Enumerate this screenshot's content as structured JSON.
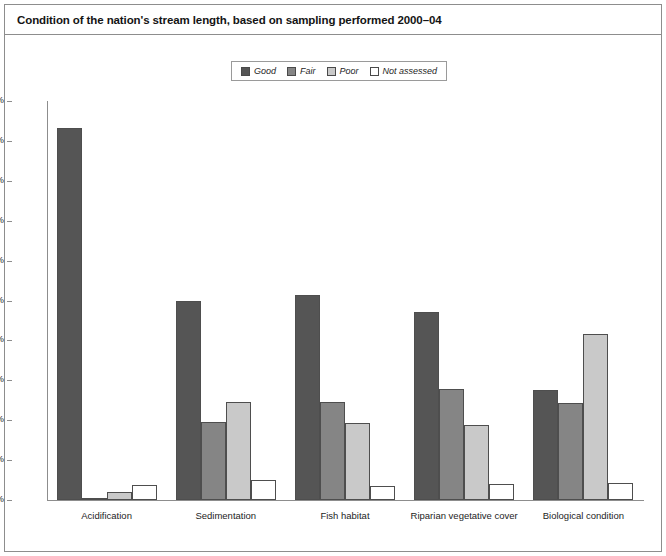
{
  "chart_data": {
    "type": "bar",
    "title": "Condition of the nation's stream length, based on sampling performed 2000–04",
    "xlabel": "",
    "ylabel": "",
    "ylim": [
      0,
      100
    ],
    "ytick_labels": [
      "0%",
      "10%",
      "20%",
      "30%",
      "40%",
      "50%",
      "60%",
      "70%",
      "80%",
      "90%",
      "100%"
    ],
    "ytick_values": [
      0,
      10,
      20,
      30,
      40,
      50,
      60,
      70,
      80,
      90,
      100
    ],
    "grid": false,
    "legend_position": "top-center",
    "categories": [
      "Acidification",
      "Sedimentation",
      "Fish habitat",
      "Riparian vegetative cover",
      "Biological condition"
    ],
    "series": [
      {
        "name": "Good",
        "color": "#555555",
        "values": [
          93.2,
          50.0,
          51.3,
          47.2,
          27.5
        ]
      },
      {
        "name": "Fair",
        "color": "#858585",
        "values": [
          0.6,
          19.5,
          24.5,
          27.8,
          24.3
        ]
      },
      {
        "name": "Poor",
        "color": "#c9c9c9",
        "values": [
          2.0,
          24.6,
          19.2,
          18.8,
          41.5
        ]
      },
      {
        "name": "Not assessed",
        "color": "#ffffff",
        "values": [
          3.8,
          5.0,
          3.6,
          4.0,
          4.2
        ]
      }
    ]
  },
  "colors": {
    "frame_border": "#8d8d8d",
    "bar_outline": "#4e4e4e",
    "text": "#1d1d1d",
    "title_text": "#141414"
  }
}
